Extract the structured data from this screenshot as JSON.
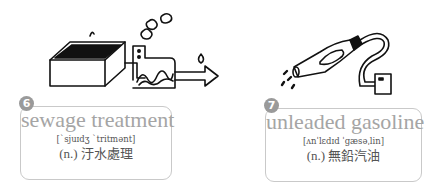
{
  "items": [
    {
      "number": "6",
      "term": "sewage treatment",
      "ipa": "[ˋsjuɪdʒ ˋtritmənt]",
      "translation": "(n.) 汙水處理",
      "illustration": "sewage-treatment-tank-illustration"
    },
    {
      "number": "7",
      "term": "unleaded gasoline",
      "ipa": "[ʌnˈlɛdɪd ˈgæsəˌlin]",
      "translation": "(n.) 無鉛汽油",
      "illustration": "gas-pump-nozzle-illustration"
    }
  ],
  "colors": {
    "badge": "#9a9a9a",
    "term": "#a5a5a5",
    "border": "#c9c9c9",
    "text": "#555555"
  }
}
